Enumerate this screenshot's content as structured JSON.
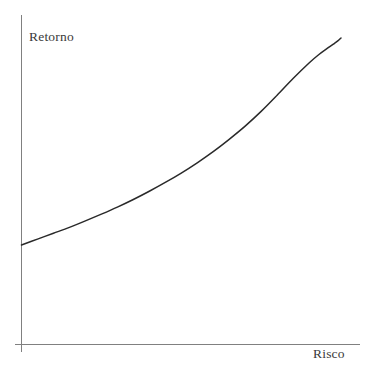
{
  "chart_data": {
    "type": "line",
    "title": "",
    "subtitle": "",
    "xlabel": "Risco",
    "ylabel": "Retorno",
    "grid": false,
    "legend": null,
    "annotations": [],
    "axis_style": {
      "x_axis_line_color": "#808080",
      "y_axis_line_color": "#808080",
      "ticks": [],
      "tick_labels": [],
      "xlim": [
        0,
        1
      ],
      "ylim": [
        0,
        1
      ]
    },
    "series": [
      {
        "name": "risco-retorno",
        "color": "#2a2a2a",
        "width": 1.5,
        "x": [
          0.0,
          0.05,
          0.1,
          0.15,
          0.2,
          0.25,
          0.3,
          0.35,
          0.4,
          0.45,
          0.5,
          0.55,
          0.6,
          0.65,
          0.7,
          0.75,
          0.8,
          0.85,
          0.9,
          0.93,
          0.96,
          0.98,
          0.99,
          1.0
        ],
        "y": [
          0.295,
          0.315,
          0.335,
          0.355,
          0.377,
          0.4,
          0.424,
          0.45,
          0.478,
          0.508,
          0.54,
          0.575,
          0.613,
          0.655,
          0.7,
          0.75,
          0.805,
          0.862,
          0.915,
          0.943,
          0.967,
          0.982,
          0.99,
          1.0
        ]
      }
    ]
  },
  "figure": {
    "background_color": "#ffffff",
    "label_color": "#3a3a3a"
  }
}
